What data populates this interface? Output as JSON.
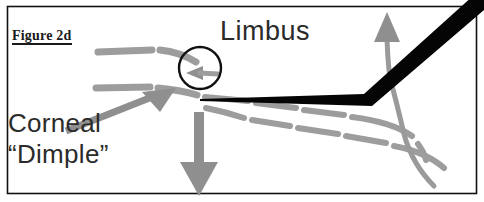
{
  "figure": {
    "id_label": "Figure 2d",
    "background_color": "#ffffff",
    "border_color": "#000000",
    "width": 484,
    "height": 202
  },
  "annotations": {
    "limbus": {
      "label": "Limbus",
      "text_color": "#2b2b2b",
      "pointer": "curved-arrow-up"
    },
    "corneal_dimple": {
      "label_line1": "Corneal",
      "label_line2": "“Dimple”",
      "text_color": "#2b2b2b",
      "pointer": "straight-arrow-up-right"
    }
  },
  "graphics": {
    "instrument_color": "#050505",
    "tissue_line_color": "#9d9d9d",
    "arrow_color": "#8f8f8f",
    "circle_outline_color": "#111111",
    "circle_center_x": 200,
    "circle_center_y": 68,
    "circle_radius": 21,
    "down_arrow_color": "#8f8f8f",
    "arc_color": "#9a9a9a"
  }
}
